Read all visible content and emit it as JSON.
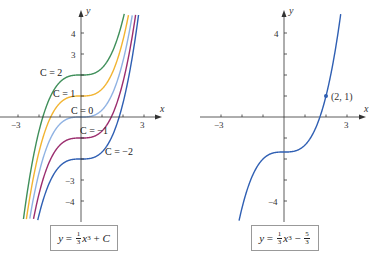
{
  "chart_data": [
    {
      "type": "line",
      "title": "y = (1/3)x^3 + C",
      "caption": {
        "lhs": "y",
        "coef_num": "1",
        "coef_den": "3",
        "var": "x",
        "exp": "3",
        "op": "+",
        "const": "C"
      },
      "xlabel": "x",
      "ylabel": "y",
      "xlim": [
        -3.6,
        4
      ],
      "ylim": [
        -5,
        5
      ],
      "x_ticks": [
        -3,
        -2,
        -1,
        0,
        1,
        2,
        3
      ],
      "x_tick_labels": [
        "-3",
        "3"
      ],
      "y_ticks": [
        -4,
        -3,
        -2,
        -1,
        1,
        2,
        3,
        4
      ],
      "y_tick_labels": [
        "4",
        "3",
        "-3",
        "-4"
      ],
      "grid": false,
      "series": [
        {
          "name": "C = 2",
          "C": 2,
          "color": "#3f8f5a",
          "label": "C = 2"
        },
        {
          "name": "C = 1",
          "C": 1,
          "color": "#f2b431",
          "label": "C = 1"
        },
        {
          "name": "C = 0",
          "C": 0,
          "color": "#8fb2e3",
          "label": "C = 0"
        },
        {
          "name": "C = -1",
          "C": -1,
          "color": "#9b2d6e",
          "label": "C = −1"
        },
        {
          "name": "C = -2",
          "C": -2,
          "color": "#2f5fb3",
          "label": "C = −2"
        }
      ]
    },
    {
      "type": "line",
      "title": "y = (1/3)x^3 - 5/3",
      "caption": {
        "lhs": "y",
        "coef_num": "1",
        "coef_den": "3",
        "var": "x",
        "exp": "3",
        "op": "−",
        "const_num": "5",
        "const_den": "3"
      },
      "xlabel": "x",
      "ylabel": "y",
      "xlim": [
        -3.6,
        4
      ],
      "ylim": [
        -5,
        5
      ],
      "x_ticks": [
        -3,
        -2,
        -1,
        0,
        1,
        2,
        3
      ],
      "x_tick_labels": [
        "-3",
        "3"
      ],
      "y_ticks": [
        -4,
        -3,
        -2,
        -1,
        1,
        2,
        3,
        4
      ],
      "y_tick_labels": [
        "4",
        "-4"
      ],
      "grid": false,
      "series": [
        {
          "name": "y = x^3/3 - 5/3",
          "C": -1.6667,
          "color": "#2f5fb3"
        }
      ],
      "annotations": [
        {
          "point": [
            2,
            1
          ],
          "label": "(2, 1)"
        }
      ]
    }
  ],
  "labels": {
    "x_axis": "x",
    "y_axis": "y",
    "neg3": "−3",
    "pos3": "3",
    "y4": "4",
    "y3": "3",
    "yneg3": "−3",
    "yneg4": "−4",
    "c2": "C = 2",
    "c1": "C = 1",
    "c0": "C = 0",
    "cm1": "C = −1",
    "cm2": "C = −2",
    "point": "(2, 1)"
  },
  "captions": {
    "left": {
      "y": "y",
      "eq": " = ",
      "num": "1",
      "den": "3",
      "x": "x",
      "exp": "3",
      "rest": " + ",
      "c": "C"
    },
    "right": {
      "y": "y",
      "eq": " = ",
      "num": "1",
      "den": "3",
      "x": "x",
      "exp": "3",
      "rest": " − ",
      "cnum": "5",
      "cden": "3"
    }
  }
}
